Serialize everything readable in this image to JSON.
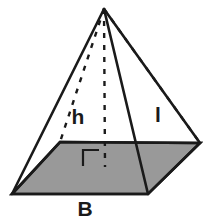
{
  "figure": {
    "kind": "geometry-diagram",
    "canvas": {
      "width": 208,
      "height": 223
    },
    "colors": {
      "background": "#ffffff",
      "base_fill": "#999999",
      "stroke": "#1a1a1a",
      "label": "#1a1a1a"
    },
    "stroke_widths": {
      "solid_edge": 2.6,
      "base_outline": 2.6,
      "dashed_edge": 2.4,
      "right_angle": 2.2
    },
    "dash_pattern": "5 7",
    "vertices": {
      "apex": {
        "label": "apex",
        "x": 104,
        "y": 9
      },
      "front_left": {
        "label": "front-left-base-corner",
        "x": 12,
        "y": 194
      },
      "front_right": {
        "label": "front-right-base-corner",
        "x": 148,
        "y": 194
      },
      "back_right": {
        "label": "back-right-base-corner",
        "x": 200,
        "y": 143
      },
      "back_left": {
        "label": "back-left-base-corner",
        "x": 60,
        "y": 142
      },
      "base_center": {
        "label": "base-center-foot-of-altitude",
        "x": 105,
        "y": 167
      }
    },
    "base_polygon_points": "12,194 148,194 200,143 60,142",
    "solid_edges": [
      {
        "name": "apex-to-front-left-edge",
        "points": "104,9 12,194"
      },
      {
        "name": "apex-to-front-right-edge",
        "points": "104,9 148,194"
      },
      {
        "name": "apex-to-back-right-edge",
        "points": "104,9 200,143"
      },
      {
        "name": "apex-to-back-left-outline",
        "points": "104,9 60,142"
      }
    ],
    "dashed_edges": [
      {
        "name": "hidden-edge-apex-to-back-left",
        "points": "104,9 60,142"
      },
      {
        "name": "altitude-apex-to-base-center",
        "points": "104,9 105,167"
      },
      {
        "name": "hidden-edge-apex-to-back-right",
        "points": "104,9 200,143"
      }
    ],
    "right_angle_marker": {
      "name": "right-angle-marker",
      "points": "83,166 83,150 99,150"
    },
    "labels": {
      "height": {
        "text": "h",
        "x": 78,
        "y": 124,
        "font_size": 21,
        "meaning": "pyramid height (altitude)"
      },
      "slant_height": {
        "text": "l",
        "x": 158,
        "y": 122,
        "font_size": 21,
        "meaning": "slant height of lateral face"
      },
      "base": {
        "text": "B",
        "x": 85,
        "y": 216,
        "font_size": 21,
        "meaning": "area of the base"
      }
    }
  }
}
